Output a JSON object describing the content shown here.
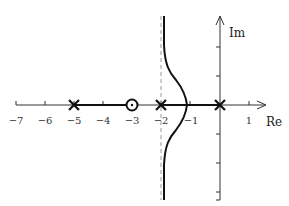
{
  "diagram": {
    "type": "root-locus",
    "axis_labels": {
      "x": "Re",
      "y": "Im"
    },
    "x_ticks": [
      {
        "value": -7,
        "label": "−7"
      },
      {
        "value": -6,
        "label": "−6"
      },
      {
        "value": -5,
        "label": "−5"
      },
      {
        "value": -4,
        "label": "−4"
      },
      {
        "value": -3,
        "label": "−3"
      },
      {
        "value": -2,
        "label": "−2"
      },
      {
        "value": -1,
        "label": "−1"
      },
      {
        "value": 1,
        "label": "1"
      }
    ],
    "poles": [
      -5,
      -2,
      0
    ],
    "zeros": [
      -3
    ],
    "asymptote_re": -2,
    "real_axis_locus_segments": [
      [
        -5,
        -3
      ],
      [
        -2,
        0
      ]
    ],
    "breakaway_re": -1.15,
    "colors": {
      "locus": "#111111",
      "axis": "#333333",
      "asymptote": "#999999"
    }
  }
}
